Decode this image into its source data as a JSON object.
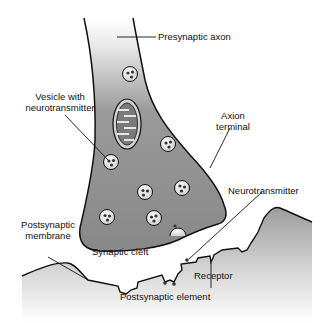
{
  "diagram": {
    "type": "anatomical-illustration",
    "labels": {
      "presynaptic_axon": "Presynaptic axon",
      "vesicle_line1": "Vesicle with",
      "vesicle_line2": "neurotransmitter",
      "axon_terminal_line1": "Axion",
      "axon_terminal_line2": "terminal",
      "neurotransmitter": "Neurotransmitter",
      "postsynaptic_membrane_line1": "Postsynaptic",
      "postsynaptic_membrane_line2": "membrane",
      "synaptic_cleft": "Synaptic cleft",
      "receptor": "Receptor",
      "postsynaptic_element": "Postsynaptic element"
    },
    "colors": {
      "terminal_fill": "#8a8a8a",
      "axon_top": "#f2f2f2",
      "outline": "#111111",
      "vesicle_fill": "#e6e6e6",
      "postsynaptic_top": "#999999",
      "postsynaptic_bottom": "#ffffff"
    }
  }
}
